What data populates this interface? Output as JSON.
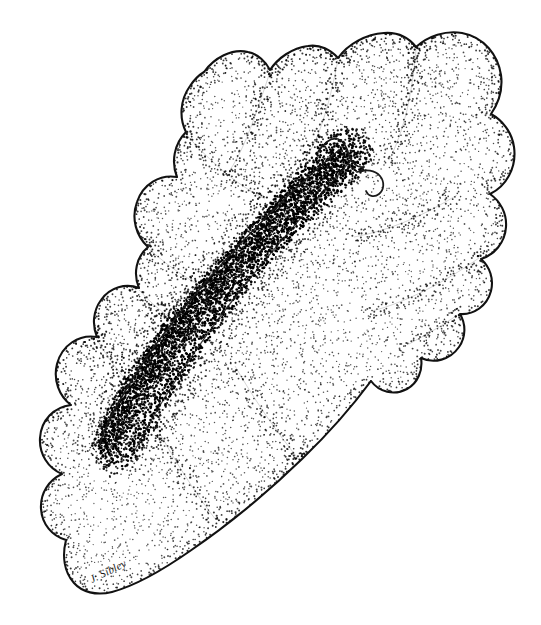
{
  "image": {
    "kind": "stipple-illustration",
    "medium": "pen-and-ink stipple drawing",
    "subject": "mammalian brain, lateral view with longitudinal sulcus",
    "background_color": "#ffffff",
    "ink_color": "#000000",
    "outline_color": "#111111",
    "width": 541,
    "height": 625
  },
  "signature": {
    "text": "J. Sibley",
    "x": 92,
    "y": 583,
    "rotation": -26
  },
  "shape": {
    "outline_label": "brain-outline",
    "outline_path": "M 204 72 C 214 58 232 48 248 52 C 258 54 266 62 270 70 C 278 58 292 48 308 46 C 320 44 331 50 338 58 C 348 44 366 34 384 33 C 398 32 409 38 416 47 C 428 36 446 30 462 33 C 484 37 498 55 501 75 C 503 90 498 104 491 114 C 502 120 512 132 514 147 C 517 168 506 186 490 194 C 500 201 507 213 506 227 C 505 243 494 255 481 259 C 490 267 494 279 491 291 C 487 306 474 315 460 314 C 466 324 466 337 459 347 C 450 360 434 364 421 358 C 423 370 418 383 407 389 C 394 396 379 392 371 381 C 354 404 330 432 302 459 C 268 492 228 525 190 551 C 160 572 134 586 112 592 C 96 596 82 592 74 583 C 64 572 62 556 66 540 C 52 536 42 524 41 509 C 40 493 49 480 62 474 C 48 468 39 454 40 438 C 41 420 54 407 71 405 C 59 396 53 380 57 364 C 62 345 79 334 97 337 C 92 325 93 311 101 300 C 110 287 126 283 139 288 C 133 274 136 257 148 247 C 136 236 131 218 137 202 C 143 184 160 174 177 177 C 171 162 174 144 186 132 C 179 118 180 100 190 86 C 194 80 199 75 204 72 Z",
    "sulcus_main_path": "M 339 150 C 326 161 310 175 292 192 C 272 211 250 233 229 256 C 207 280 186 305 169 327 C 152 349 138 370 127 388 C 118 403 111 416 106 427 C 103 434 101 440 100 445",
    "sulcus_lower_path": "M 351 160 C 341 172 328 187 312 205 C 294 226 273 250 252 276 C 230 303 209 331 192 356 C 175 381 161 403 151 421 C 143 435 137 446 133 454",
    "hook_upper_path": "M 318 152 C 324 143 331 137 338 139 C 344 141 347 148 349 155 C 352 163 357 168 364 167",
    "hook_lower_path": "M 357 172 C 366 169 375 170 380 176 C 385 182 384 190 379 194 C 374 198 368 196 366 191",
    "gyri_folds": [
      "M 270 72 C 264 90 258 108 252 124 C 245 143 238 158 230 170",
      "M 338 60 C 334 80 330 98 325 114 C 320 131 314 145 307 156",
      "M 416 50 C 414 72 411 92 407 110 C 402 130 396 147 389 160",
      "M 186 134 C 196 146 208 158 221 169 C 236 182 251 192 265 199",
      "M 148 248 C 160 259 174 270 189 279 C 203 288 216 294 227 298",
      "M 139 290 C 148 300 159 310 171 318",
      "M 457 195 C 441 205 424 214 407 221 C 388 229 370 234 354 237",
      "M 479 258 C 462 270 444 281 426 290 C 406 300 388 307 372 311",
      "M 459 314 C 443 325 426 335 409 344",
      "M 300 461 C 288 446 276 430 265 414 C 253 396 243 380 235 366",
      "M 216 520 C 205 506 194 490 184 474 C 173 457 164 441 157 428",
      "M 96 338 C 104 352 114 366 125 379"
    ]
  },
  "stipple": {
    "description": "hand-applied ink dots forming tonal gradients",
    "field_density_label": "medium",
    "shadow_band_label": "dense",
    "dot_color": "#000000",
    "seed": 20240517
  },
  "regions": [
    {
      "name": "dorsal-lobe-upper-left",
      "tone": "light"
    },
    {
      "name": "dorsal-lobe-upper-right",
      "tone": "medium"
    },
    {
      "name": "longitudinal-sulcus",
      "tone": "dark"
    },
    {
      "name": "ventral-lobe-lower-left",
      "tone": "light"
    },
    {
      "name": "caudal-taper",
      "tone": "light"
    }
  ]
}
